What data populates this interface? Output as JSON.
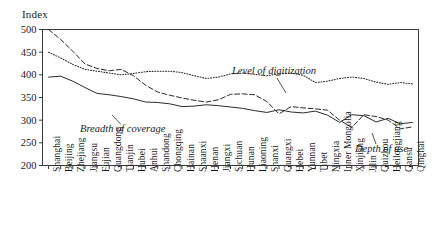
{
  "chart_data": {
    "type": "line",
    "title": "",
    "xlabel": "",
    "ylabel": "Index",
    "ylim": [
      200,
      500
    ],
    "yticks": [
      200,
      250,
      300,
      350,
      400,
      450,
      500
    ],
    "grid": false,
    "legend_position": "inline-annotations",
    "categories": [
      "Shanghai",
      "Beijing",
      "Zhejiang",
      "Jiangsu",
      "Fujian",
      "Guangdong",
      "Tianjin",
      "Hubei",
      "Anhui",
      "Shandong",
      "Chongqing",
      "Hainan",
      "Shaanxi",
      "Henan",
      "Jiangxi",
      "Sichuan",
      "Hunan",
      "Liaoning",
      "Shanxi",
      "Guangxi",
      "Hebei",
      "Yunnan",
      "Tibet",
      "Ningxia",
      "Inner Mongolia",
      "Xinjiang",
      "Jilin",
      "Guizhou",
      "Heilongjiang",
      "Gansu",
      "Qinghai"
    ],
    "series": [
      {
        "name": "Level of digitization",
        "style": "dotted",
        "values": [
          450,
          437,
          423,
          412,
          408,
          404,
          400,
          403,
          407,
          408,
          408,
          405,
          398,
          392,
          395,
          402,
          404,
          401,
          398,
          402,
          404,
          399,
          383,
          386,
          392,
          395,
          392,
          384,
          379,
          383,
          380
        ]
      },
      {
        "name": "Depth of use",
        "style": "dashed",
        "values": [
          500,
          478,
          452,
          424,
          414,
          409,
          412,
          398,
          377,
          362,
          355,
          349,
          344,
          340,
          345,
          357,
          358,
          356,
          341,
          314,
          330,
          327,
          325,
          322,
          300,
          284,
          312,
          308,
          300,
          281,
          285
        ]
      },
      {
        "name": "Breadth of coverage",
        "style": "solid",
        "values": [
          395,
          397,
          386,
          372,
          359,
          356,
          352,
          347,
          340,
          339,
          336,
          330,
          331,
          334,
          332,
          329,
          326,
          321,
          317,
          323,
          318,
          316,
          320,
          311,
          295,
          312,
          310,
          296,
          304,
          292,
          295
        ]
      }
    ],
    "annotations": [
      {
        "text": "Level of digitization",
        "target_series": "Level of digitization"
      },
      {
        "text": "Breadth of coverage",
        "target_series": "Breadth of coverage"
      },
      {
        "text": "Depth of use",
        "target_series": "Depth of use"
      }
    ]
  }
}
